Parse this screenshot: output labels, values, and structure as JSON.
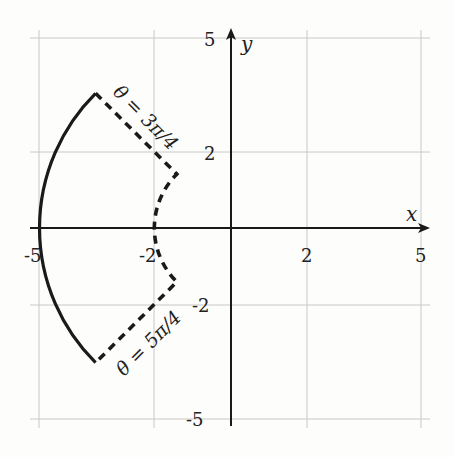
{
  "figure": {
    "type": "polar-region-diagram",
    "axes": {
      "x_label": "x",
      "y_label": "y",
      "x_ticks": [
        "-5",
        "-2",
        "2",
        "5"
      ],
      "y_ticks": [
        "5",
        "2",
        "-2",
        "-5"
      ],
      "range": [
        -5,
        5
      ]
    },
    "curves": [
      {
        "name": "outer-arc",
        "description": "r = 5, θ from 3π/4 to 5π/4",
        "style": "solid"
      },
      {
        "name": "inner-boundary",
        "description": "rays θ = 3π/4 and θ = 5π/4 joined by inner arc r = 2",
        "style": "dashed"
      }
    ],
    "annotations": {
      "upper_ray": "θ = 3π/4",
      "lower_ray": "θ = 5π/4"
    },
    "colors": {
      "ink": "#1a1a1a",
      "grid": "#c8c8c8",
      "background": "#fdfdfb"
    }
  }
}
